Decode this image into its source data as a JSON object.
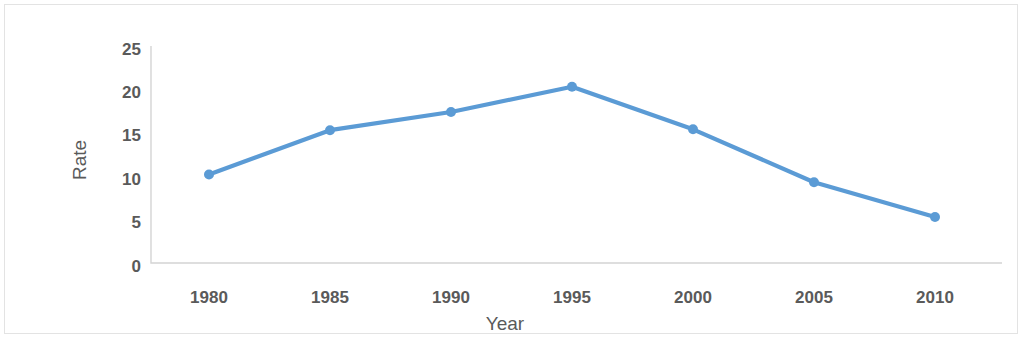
{
  "chart_data": {
    "type": "line",
    "title": "",
    "xlabel": "Year",
    "ylabel": "Rate",
    "categories": [
      "1980",
      "1985",
      "1990",
      "1995",
      "2000",
      "2005",
      "2010"
    ],
    "x": [
      1980,
      1985,
      1990,
      1995,
      2000,
      2005,
      2010
    ],
    "values": [
      10.2,
      15.3,
      17.4,
      20.3,
      15.4,
      9.3,
      5.3
    ],
    "series": [
      {
        "name": "Rate",
        "values": [
          10.2,
          15.3,
          17.4,
          20.3,
          15.4,
          9.3,
          5.3
        ]
      }
    ],
    "y_ticks": [
      "0",
      "5",
      "10",
      "15",
      "20",
      "25"
    ],
    "y_tick_values": [
      0,
      5,
      10,
      15,
      20,
      25
    ],
    "ylim": [
      0,
      25
    ],
    "xlim": [
      1980,
      2010
    ],
    "grid": false,
    "legend": false,
    "legend_position": "none",
    "series_color": "#5b9bd5",
    "marker": "circle",
    "marker_size": 9,
    "axis_color": "#d4d4d4",
    "text_color": "#5a5a5a",
    "frame_color": "#e3e3e3",
    "background": "#ffffff"
  }
}
